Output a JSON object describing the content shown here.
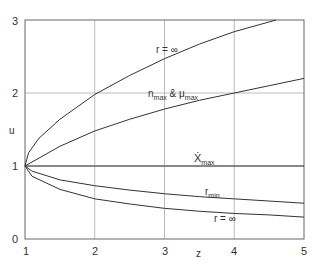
{
  "chart_data": {
    "type": "line",
    "title": "",
    "xlabel": "z",
    "ylabel": "u",
    "xlim": [
      1,
      5
    ],
    "ylim": [
      0,
      3
    ],
    "xticks": [
      "1",
      "2",
      "3",
      "4",
      "5"
    ],
    "yticks": [
      "0",
      "1",
      "2",
      "3"
    ],
    "grid": true,
    "series": [
      {
        "name": "r = ∞ (upper)",
        "x": [
          1,
          1.05,
          1.2,
          1.5,
          2,
          2.5,
          3,
          3.5,
          4,
          4.6
        ],
        "values": [
          1,
          1.18,
          1.38,
          1.64,
          1.98,
          2.24,
          2.47,
          2.67,
          2.84,
          3.0
        ]
      },
      {
        "name": "n_max & μ_max",
        "x": [
          1,
          1.5,
          2,
          2.5,
          3,
          3.5,
          4,
          4.5,
          5
        ],
        "values": [
          1,
          1.27,
          1.48,
          1.64,
          1.78,
          1.9,
          2.0,
          2.1,
          2.2
        ]
      },
      {
        "name": "Ẋ_max",
        "x": [
          1,
          5
        ],
        "values": [
          1,
          1
        ]
      },
      {
        "name": "r_min",
        "x": [
          1,
          1.1,
          1.5,
          2,
          2.5,
          3,
          3.5,
          4,
          4.5,
          5
        ],
        "values": [
          1,
          0.93,
          0.81,
          0.73,
          0.67,
          0.62,
          0.58,
          0.55,
          0.52,
          0.49
        ]
      },
      {
        "name": "r = ∞ (lower)",
        "x": [
          1,
          1.1,
          1.5,
          2,
          2.5,
          3,
          3.5,
          4,
          4.5,
          5
        ],
        "values": [
          1,
          0.86,
          0.68,
          0.55,
          0.48,
          0.42,
          0.38,
          0.35,
          0.33,
          0.3
        ]
      }
    ],
    "annotations": [
      "r = ∞",
      "n_max & μ_max",
      "Ẋ_max",
      "r_min",
      "r = ∞"
    ]
  },
  "labels": {
    "y3": "3",
    "y2": "2",
    "y1": "1",
    "y0": "0",
    "x1": "1",
    "x2": "2",
    "x3": "3",
    "x4": "4",
    "x5": "5",
    "xlabel": "z",
    "ylabel": "u"
  }
}
